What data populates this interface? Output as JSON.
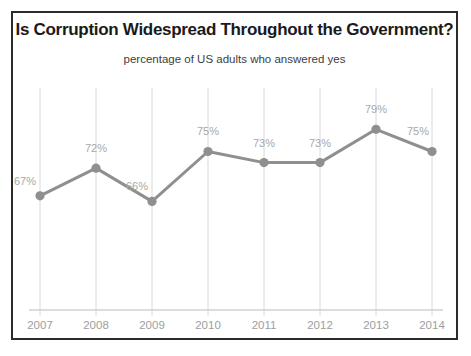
{
  "chart_data": {
    "type": "line",
    "title": "Is Corruption Widespread Throughout the Government?",
    "subtitle": "percentage of US adults who answered yes",
    "xlabel": "",
    "ylabel": "",
    "categories": [
      "2007",
      "2008",
      "2009",
      "2010",
      "2011",
      "2012",
      "2013",
      "2014"
    ],
    "values": [
      67,
      72,
      66,
      75,
      73,
      73,
      79,
      75
    ],
    "value_labels": [
      "67%",
      "72%",
      "66%",
      "75%",
      "73%",
      "73%",
      "79%",
      "75%"
    ],
    "ylim": [
      54,
      85
    ],
    "grid": "vertical-only",
    "legend": "none",
    "series": [
      {
        "name": "percentage of US adults who answered yes",
        "values": [
          67,
          72,
          66,
          75,
          73,
          73,
          79,
          75
        ]
      }
    ],
    "colors": {
      "line": "#8f8f8f",
      "marker": "#8f8f8f",
      "value_label": "#a8a8a8",
      "tick_label": "#9e9e9e",
      "gridline": "#d8d8d8",
      "axis": "#bcbcbc",
      "title": "#1a1a1a",
      "subtitle": "#3d3d3d",
      "frame": "#2b2b2b",
      "background": "#ffffff"
    }
  }
}
